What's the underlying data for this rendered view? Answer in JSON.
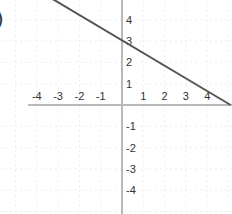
{
  "label_prefix": ")",
  "colors": {
    "background": "#ffffff",
    "axis": "#b8b8b8",
    "grid": "#eeeeee",
    "line": "#555555",
    "text": "#333333"
  },
  "chart_data": {
    "type": "line",
    "title": "",
    "xlabel": "",
    "ylabel": "",
    "xlim": [
      -5.8,
      5.2
    ],
    "ylim": [
      -5.0,
      5.0
    ],
    "grid": true,
    "x_ticks": [
      -4,
      -3,
      -2,
      -1,
      1,
      2,
      3,
      4
    ],
    "y_ticks": [
      4,
      3,
      2,
      1,
      -1,
      -2,
      -3,
      -4
    ],
    "x_tick_labels": [
      "-4",
      "-3",
      "-2",
      "-1",
      "1",
      "2",
      "3",
      "4"
    ],
    "y_tick_labels": [
      "4",
      "3",
      "2",
      "1",
      "-1",
      "-2",
      "-3",
      "-4"
    ],
    "series": [
      {
        "name": "line",
        "x": [
          -3.3,
          5.1
        ],
        "y": [
          5.0,
          0.0
        ],
        "equation": "y ≈ 3 − 0.6x",
        "y_intercept": 3,
        "x_intercept": 5
      }
    ]
  }
}
